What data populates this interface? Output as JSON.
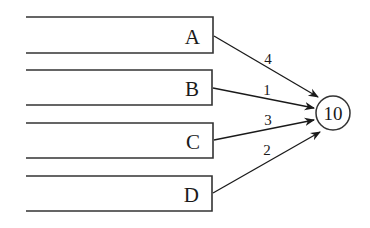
{
  "diagram": {
    "type": "weighted-inputs-to-node",
    "inputs": [
      {
        "label": "A",
        "weight": "4"
      },
      {
        "label": "B",
        "weight": "1"
      },
      {
        "label": "C",
        "weight": "3"
      },
      {
        "label": "D",
        "weight": "2"
      }
    ],
    "output_node": {
      "label": "10"
    },
    "colors": {
      "stroke": "#333333",
      "text": "#1a1a1a",
      "background": "#ffffff"
    }
  }
}
